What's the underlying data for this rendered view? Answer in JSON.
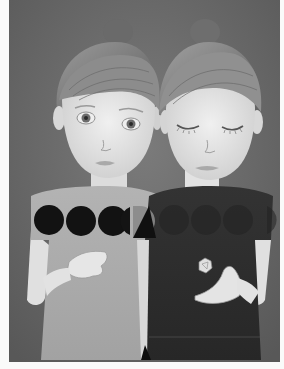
{
  "image": {
    "title": "Twin girls illustration",
    "description": "Grayscale pencil drawing of two girls side by side with hair in top buns; left girl with open eyes wearing a light gray dress with a row of black circles across the chest; right girl with closed eyes wearing a dark dress, holding a small white polyhedron in her hand.",
    "palette": {
      "background": "#6f6f6f",
      "background_dark": "#5a5a5a",
      "skin": "#e6e6e6",
      "skin_shadow": "#c9c9c9",
      "hair": "#8a8a8a",
      "hair_dark": "#5e5e5e",
      "dress_light": "#a9a9a9",
      "dress_dark": "#2e2e2e",
      "circles": "#121212",
      "border": "#fafafa"
    },
    "figures": [
      {
        "name": "left-girl",
        "eyes": "open",
        "dress": "light"
      },
      {
        "name": "right-girl",
        "eyes": "closed",
        "dress": "dark",
        "holding": "polyhedron"
      }
    ]
  }
}
